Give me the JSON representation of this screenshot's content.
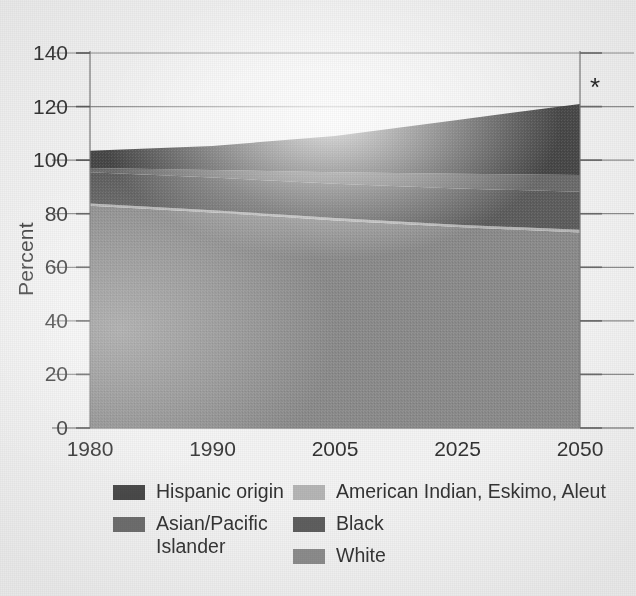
{
  "chart_data": {
    "type": "area",
    "title": "",
    "subtitle": "",
    "xlabel": "",
    "ylabel": "Percent",
    "x": [
      1980,
      1990,
      2005,
      2025,
      2050
    ],
    "xtick_labels": [
      "1980",
      "1990",
      "2005",
      "2025",
      "2050"
    ],
    "ytick_labels": [
      "0",
      "20",
      "40",
      "60",
      "80",
      "100",
      "120",
      "140"
    ],
    "yticks": [
      0,
      20,
      40,
      60,
      80,
      100,
      120,
      140
    ],
    "ylim": [
      0,
      140
    ],
    "grid": "horizontal",
    "stacked": true,
    "legend_position": "bottom",
    "annotations": [
      {
        "text": "*",
        "x": 2050,
        "y": 121,
        "name": "projection-asterisk"
      }
    ],
    "series": [
      {
        "name": "White",
        "color": "#8c8c8c",
        "values": [
          83.0,
          80.5,
          77.5,
          75.0,
          73.0
        ]
      },
      {
        "name": "American Indian, Eskimo, Aleut",
        "color": "#b6b6b6",
        "values": [
          0.8,
          0.8,
          0.9,
          0.9,
          1.0
        ]
      },
      {
        "name": "Black",
        "color": "#5e5e5e",
        "values": [
          11.7,
          12.2,
          12.8,
          13.5,
          14.2
        ]
      },
      {
        "name": "Asian/Pacific Islander",
        "color": "#6c6c6c",
        "values": [
          1.6,
          2.8,
          4.3,
          5.5,
          6.3
        ]
      },
      {
        "name": "Hispanic origin",
        "color": "#474747",
        "values": [
          6.4,
          9.0,
          13.5,
          20.1,
          26.5
        ]
      }
    ],
    "series_totals": [
      103.5,
      105.3,
      109.0,
      115.0,
      121.0
    ]
  },
  "axis": {
    "y_label": "Percent",
    "y_ticks": [
      "140",
      "120",
      "100",
      "80",
      "60",
      "40",
      "20",
      "0"
    ],
    "x_ticks": [
      "1980",
      "1990",
      "2005",
      "2025",
      "2050"
    ]
  },
  "legend": {
    "columns": [
      {
        "items": [
          {
            "label": "Hispanic origin",
            "color": "#474747",
            "swatch_name": "legend-swatch-hispanic-origin"
          },
          {
            "label": "Asian/Pacific Islander",
            "color": "#6c6c6c",
            "swatch_name": "legend-swatch-asian-pacific-islander"
          }
        ]
      },
      {
        "items": [
          {
            "label": "American Indian, Eskimo, Aleut",
            "color": "#b6b6b6",
            "swatch_name": "legend-swatch-american-indian"
          },
          {
            "label": "Black",
            "color": "#5e5e5e",
            "swatch_name": "legend-swatch-black"
          },
          {
            "label": "White",
            "color": "#8c8c8c",
            "swatch_name": "legend-swatch-white"
          }
        ]
      }
    ]
  },
  "marks": {
    "asterisk": "*"
  },
  "colors": {
    "background": "#f4f4f4",
    "gridline": "#8d8d8d",
    "axis": "#6f6f6f",
    "text": "#333333"
  }
}
